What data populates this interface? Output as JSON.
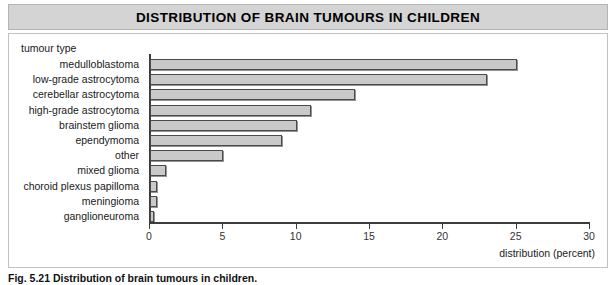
{
  "figure": {
    "title": "DISTRIBUTION OF BRAIN TUMOURS IN CHILDREN",
    "caption": "Fig. 5.21 Distribution of brain tumours in children.",
    "colors": {
      "title_band": "#d4d4d4",
      "bar_fill": "#c9c9c9",
      "bar_border": "#4a4a4a",
      "axis": "#3c3c3c",
      "panel_border": "#c2c2c2"
    }
  },
  "chart_data": {
    "type": "bar",
    "orientation": "horizontal",
    "title": "DISTRIBUTION OF BRAIN TUMOURS IN CHILDREN",
    "xlabel": "distribution (percent)",
    "ylabel": "tumour type",
    "xlim": [
      0,
      30
    ],
    "xticks": [
      0,
      5,
      10,
      15,
      20,
      25,
      30
    ],
    "xtick_labels": [
      "0",
      "5",
      "10",
      "15",
      "20",
      "25",
      "30"
    ],
    "grid": false,
    "legend": null,
    "categories": [
      "medulloblastoma",
      "low-grade astrocytoma",
      "cerebellar astrocytoma",
      "high-grade astrocytoma",
      "brainstem glioma",
      "ependymoma",
      "other",
      "mixed glioma",
      "choroid plexus papilloma",
      "meningioma",
      "ganglioneuroma"
    ],
    "values": [
      25,
      23,
      14,
      11,
      10,
      9,
      5,
      1.1,
      0.5,
      0.5,
      0.3
    ]
  }
}
